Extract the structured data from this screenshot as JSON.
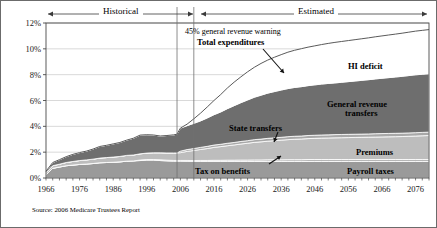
{
  "figure": {
    "source_note": "Source: 2006 Medicare Trustees Report",
    "period_historical": "Historical",
    "period_estimated": "Estimated",
    "border_color": "#6b6b6b"
  },
  "chart_data": {
    "type": "area",
    "title": "",
    "subtitle": "",
    "xlabel": "",
    "ylabel": "",
    "stacked": true,
    "grid": true,
    "legend_position": "inline-annotations",
    "xlim": [
      1966,
      2080
    ],
    "ylim": [
      0,
      12
    ],
    "xticks": [
      1966,
      1976,
      1986,
      1996,
      2006,
      2016,
      2026,
      2036,
      2046,
      2056,
      2066,
      2076
    ],
    "xtick_labels": [
      "1966",
      "1976",
      "1986",
      "1996",
      "2006",
      "2016",
      "2026",
      "2036",
      "2046",
      "2056",
      "2066",
      "2076"
    ],
    "yticks": [
      0,
      2,
      4,
      6,
      8,
      10,
      12
    ],
    "ytick_labels": [
      "0%",
      "2%",
      "4%",
      "6%",
      "8%",
      "10%",
      "12%"
    ],
    "history_end_year": 2005,
    "warning_line_year": 2010,
    "colors": {
      "payroll_taxes": "#9a9a9a",
      "tax_on_benefits": "#b5b5b5",
      "premiums": "#bdbdbd",
      "state_transfers": "#a8a8a8",
      "general_revenue_transfers": "#6e6e6e",
      "hi_deficit": "#ffffff",
      "total_expenditures_line": "#5a5a5a",
      "grid": "#c8c8c8",
      "axis": "#4a4a4a"
    },
    "x": [
      1966,
      1968,
      1970,
      1972,
      1974,
      1976,
      1978,
      1980,
      1982,
      1984,
      1986,
      1988,
      1990,
      1992,
      1994,
      1996,
      1998,
      2000,
      2002,
      2004,
      2005,
      2006,
      2008,
      2010,
      2012,
      2014,
      2016,
      2018,
      2020,
      2022,
      2024,
      2026,
      2028,
      2030,
      2032,
      2034,
      2036,
      2038,
      2040,
      2042,
      2044,
      2046,
      2048,
      2050,
      2052,
      2054,
      2056,
      2058,
      2060,
      2062,
      2064,
      2066,
      2068,
      2070,
      2072,
      2074,
      2076,
      2078,
      2080
    ],
    "series": [
      {
        "name": "Payroll taxes",
        "key": "payroll_taxes",
        "label": "Payroll taxes",
        "values": [
          0.25,
          0.75,
          0.85,
          0.95,
          1.0,
          1.05,
          1.08,
          1.12,
          1.18,
          1.2,
          1.22,
          1.25,
          1.3,
          1.32,
          1.35,
          1.38,
          1.38,
          1.35,
          1.32,
          1.3,
          1.3,
          1.3,
          1.29,
          1.28,
          1.28,
          1.28,
          1.28,
          1.28,
          1.28,
          1.28,
          1.28,
          1.28,
          1.28,
          1.28,
          1.28,
          1.28,
          1.28,
          1.28,
          1.28,
          1.28,
          1.28,
          1.28,
          1.28,
          1.28,
          1.28,
          1.28,
          1.28,
          1.28,
          1.28,
          1.28,
          1.28,
          1.28,
          1.28,
          1.28,
          1.28,
          1.28,
          1.28,
          1.28,
          1.28
        ]
      },
      {
        "name": "Tax on benefits",
        "key": "tax_on_benefits",
        "label": "Tax on benefits",
        "values": [
          0.0,
          0.0,
          0.0,
          0.0,
          0.0,
          0.0,
          0.0,
          0.0,
          0.0,
          0.0,
          0.0,
          0.0,
          0.0,
          0.0,
          0.04,
          0.05,
          0.05,
          0.06,
          0.06,
          0.06,
          0.06,
          0.06,
          0.07,
          0.07,
          0.08,
          0.08,
          0.09,
          0.09,
          0.1,
          0.1,
          0.11,
          0.11,
          0.12,
          0.12,
          0.13,
          0.13,
          0.13,
          0.14,
          0.14,
          0.14,
          0.15,
          0.15,
          0.15,
          0.15,
          0.15,
          0.15,
          0.15,
          0.15,
          0.15,
          0.15,
          0.15,
          0.15,
          0.15,
          0.15,
          0.15,
          0.15,
          0.15,
          0.15,
          0.15
        ]
      },
      {
        "name": "Premiums",
        "key": "premiums",
        "label": "Premiums",
        "values": [
          0.15,
          0.2,
          0.22,
          0.25,
          0.28,
          0.3,
          0.32,
          0.34,
          0.36,
          0.38,
          0.4,
          0.42,
          0.45,
          0.46,
          0.48,
          0.5,
          0.52,
          0.54,
          0.56,
          0.58,
          0.58,
          0.6,
          0.7,
          0.78,
          0.85,
          0.92,
          1.0,
          1.06,
          1.12,
          1.18,
          1.24,
          1.3,
          1.36,
          1.4,
          1.44,
          1.48,
          1.52,
          1.55,
          1.58,
          1.6,
          1.62,
          1.64,
          1.66,
          1.67,
          1.68,
          1.69,
          1.7,
          1.71,
          1.72,
          1.73,
          1.74,
          1.75,
          1.76,
          1.77,
          1.78,
          1.8,
          1.82,
          1.84,
          1.86
        ]
      },
      {
        "name": "State transfers",
        "key": "state_transfers",
        "label": "State transfers",
        "values": [
          0.0,
          0.0,
          0.0,
          0.0,
          0.0,
          0.0,
          0.0,
          0.0,
          0.0,
          0.0,
          0.0,
          0.0,
          0.0,
          0.0,
          0.0,
          0.0,
          0.0,
          0.0,
          0.0,
          0.0,
          0.0,
          0.12,
          0.14,
          0.15,
          0.16,
          0.17,
          0.18,
          0.18,
          0.19,
          0.19,
          0.2,
          0.2,
          0.21,
          0.21,
          0.22,
          0.22,
          0.22,
          0.23,
          0.23,
          0.23,
          0.24,
          0.24,
          0.24,
          0.24,
          0.25,
          0.25,
          0.25,
          0.25,
          0.25,
          0.25,
          0.26,
          0.26,
          0.26,
          0.26,
          0.26,
          0.26,
          0.26,
          0.26,
          0.26
        ]
      },
      {
        "name": "General revenue transfers",
        "key": "general_revenue_transfers",
        "label": "General revenue transfers",
        "values": [
          0.12,
          0.25,
          0.35,
          0.45,
          0.55,
          0.62,
          0.68,
          0.78,
          0.9,
          0.95,
          1.02,
          1.08,
          1.18,
          1.3,
          1.45,
          1.42,
          1.38,
          1.3,
          1.35,
          1.4,
          1.45,
          1.78,
          1.85,
          1.95,
          2.05,
          2.2,
          2.35,
          2.5,
          2.68,
          2.85,
          3.0,
          3.15,
          3.28,
          3.4,
          3.5,
          3.58,
          3.66,
          3.72,
          3.78,
          3.82,
          3.86,
          3.9,
          3.94,
          3.98,
          4.0,
          4.04,
          4.08,
          4.12,
          4.16,
          4.2,
          4.24,
          4.28,
          4.32,
          4.36,
          4.4,
          4.44,
          4.48,
          4.5,
          4.52
        ]
      },
      {
        "name": "HI deficit",
        "key": "hi_deficit",
        "label": "HI deficit",
        "values": [
          0.0,
          0.0,
          0.0,
          0.0,
          0.0,
          0.0,
          0.0,
          0.0,
          0.0,
          0.0,
          0.0,
          0.0,
          0.0,
          0.0,
          0.0,
          0.0,
          0.0,
          0.0,
          0.0,
          0.0,
          0.0,
          0.0,
          0.12,
          0.35,
          0.6,
          0.85,
          1.1,
          1.35,
          1.6,
          1.82,
          2.0,
          2.18,
          2.32,
          2.46,
          2.56,
          2.66,
          2.74,
          2.82,
          2.88,
          2.94,
          2.98,
          3.02,
          3.06,
          3.1,
          3.14,
          3.16,
          3.18,
          3.2,
          3.22,
          3.24,
          3.26,
          3.28,
          3.3,
          3.32,
          3.34,
          3.36,
          3.38,
          3.4,
          3.42
        ]
      }
    ],
    "total_expenditures": {
      "name": "Total expenditures",
      "label": "Total expenditures",
      "values": [
        0.52,
        1.2,
        1.42,
        1.65,
        1.83,
        1.97,
        2.08,
        2.24,
        2.44,
        2.53,
        2.64,
        2.75,
        2.93,
        3.08,
        3.32,
        3.35,
        3.33,
        3.25,
        3.29,
        3.34,
        3.39,
        3.86,
        4.17,
        4.58,
        5.02,
        5.5,
        6.0,
        6.46,
        6.97,
        7.42,
        7.83,
        8.22,
        8.57,
        8.87,
        9.13,
        9.35,
        9.55,
        9.74,
        9.89,
        10.01,
        10.13,
        10.23,
        10.33,
        10.42,
        10.5,
        10.57,
        10.64,
        10.71,
        10.78,
        10.85,
        10.93,
        11.0,
        11.07,
        11.14,
        11.21,
        11.29,
        11.37,
        11.43,
        11.49
      ]
    },
    "annotations": [
      {
        "key": "warning",
        "text": "45% general revenue warning",
        "style": "gray"
      },
      {
        "key": "total_expenditures",
        "text": "Total expenditures",
        "style": "bold-callout"
      },
      {
        "key": "hi_deficit",
        "text": "HI deficit",
        "style": "bold"
      },
      {
        "key": "general_revenue_transfers_l1",
        "text": "General revenue",
        "style": "bold"
      },
      {
        "key": "general_revenue_transfers_l2",
        "text": "transfers",
        "style": "bold"
      },
      {
        "key": "state_transfers",
        "text": "State transfers",
        "style": "bold-callout"
      },
      {
        "key": "premiums",
        "text": "Premiums",
        "style": "bold"
      },
      {
        "key": "tax_on_benefits",
        "text": "Tax on benefits",
        "style": "bold-callout"
      },
      {
        "key": "payroll_taxes",
        "text": "Payroll taxes",
        "style": "bold"
      }
    ]
  }
}
